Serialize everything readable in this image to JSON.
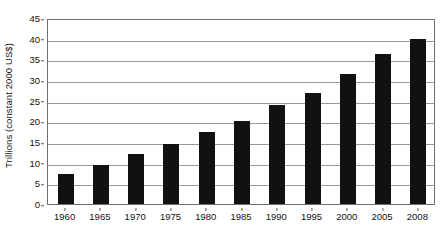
{
  "chart_data": {
    "type": "bar",
    "title": "",
    "subtitle": "",
    "xlabel": "",
    "ylabel": "Trillions (constant 2000 US$)",
    "categories": [
      "1960",
      "1965",
      "1970",
      "1975",
      "1980",
      "1985",
      "1990",
      "1995",
      "2000",
      "2005",
      "2008"
    ],
    "values": [
      7.2,
      9.5,
      12.1,
      14.5,
      17.5,
      20.0,
      24.0,
      26.8,
      31.5,
      36.3,
      40.0
    ],
    "series": [
      {
        "name": "",
        "values": [
          7.2,
          9.5,
          12.1,
          14.5,
          17.5,
          20.0,
          24.0,
          26.8,
          31.5,
          36.3,
          40.0
        ]
      }
    ],
    "ylim": [
      0,
      45
    ],
    "yticks": [
      0,
      5,
      10,
      15,
      20,
      25,
      30,
      35,
      40,
      45
    ],
    "ytick_labels": [
      "0",
      "5",
      "10",
      "15",
      "20",
      "25",
      "30",
      "35",
      "40",
      "45"
    ],
    "grid": "horizontal",
    "legend": "none",
    "bar_color": "#111111",
    "gridline_color": "#9a9a9a",
    "axis_color": "#6e6e6e",
    "background_color": "#ffffff",
    "annotations": []
  }
}
